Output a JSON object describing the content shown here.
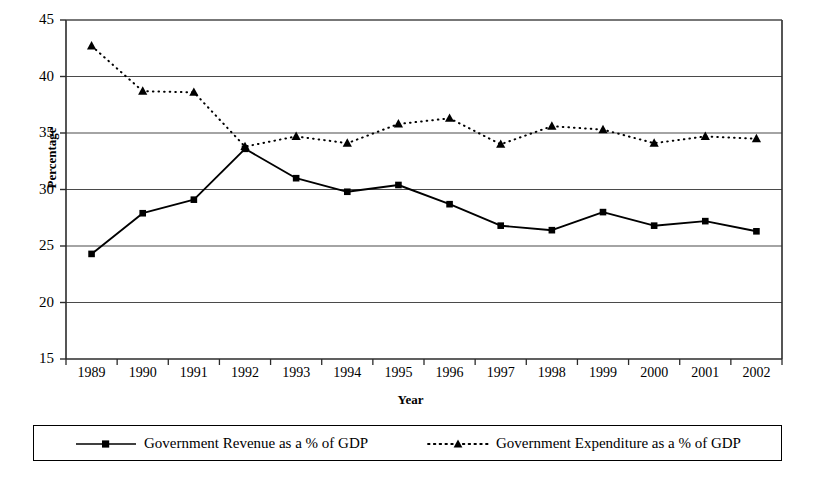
{
  "chart_data": {
    "type": "line",
    "title": "",
    "xlabel": "Year",
    "ylabel": "Percentage",
    "categories": [
      "1989",
      "1990",
      "1991",
      "1992",
      "1993",
      "1994",
      "1995",
      "1996",
      "1997",
      "1998",
      "1999",
      "2000",
      "2001",
      "2002"
    ],
    "ylim": [
      15,
      45
    ],
    "ytick_labels": [
      "45",
      "40",
      "35",
      "30",
      "25",
      "20",
      "15"
    ],
    "ytick_values": [
      45,
      40,
      35,
      30,
      25,
      20,
      15
    ],
    "grid": "horizontal",
    "legend_position": "bottom",
    "series": [
      {
        "name": "Government Revenue as a % of GDP",
        "marker": "square",
        "linestyle": "solid",
        "color": "#000000",
        "values": [
          24.3,
          27.9,
          29.1,
          33.6,
          31.0,
          29.8,
          30.4,
          28.7,
          26.8,
          26.4,
          28.0,
          26.8,
          27.2,
          26.3
        ]
      },
      {
        "name": "Government Expenditure as a % of GDP",
        "marker": "triangle",
        "linestyle": "dotted",
        "color": "#000000",
        "values": [
          42.7,
          38.7,
          38.6,
          33.8,
          34.7,
          34.1,
          35.8,
          36.3,
          34.0,
          35.6,
          35.3,
          34.1,
          34.7,
          34.5
        ]
      }
    ]
  },
  "legend": {
    "entries": [
      {
        "label": "Government Revenue as a % of GDP",
        "symbol": "solid-line-square-marker"
      },
      {
        "label": "Government Expenditure as a % of GDP",
        "symbol": "dotted-line-triangle-marker"
      }
    ]
  },
  "axes": {
    "y_title": "Percentage",
    "x_title": "Year"
  }
}
